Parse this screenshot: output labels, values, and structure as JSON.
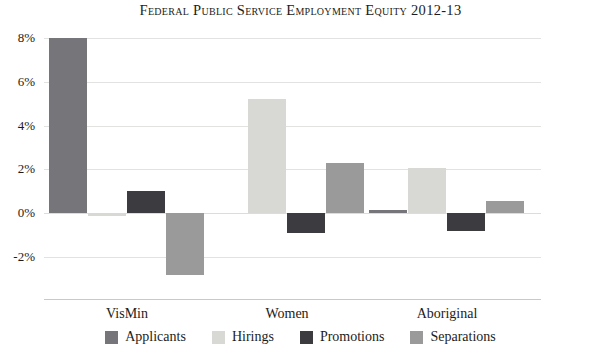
{
  "chart_data": {
    "type": "bar",
    "title": "Federal Public Service Employment Equity 2012-13",
    "xlabel": "",
    "ylabel": "",
    "categories": [
      "VisMin",
      "Women",
      "Aboriginal"
    ],
    "series": [
      {
        "name": "Applicants",
        "color": "#76767a",
        "values": [
          8.0,
          0.0,
          0.15
        ]
      },
      {
        "name": "Hirings",
        "color": "#d8d8d4",
        "values": [
          -0.15,
          5.2,
          2.05
        ]
      },
      {
        "name": "Promotions",
        "color": "#3c3c40",
        "values": [
          1.0,
          -0.9,
          -0.8
        ]
      },
      {
        "name": "Separations",
        "color": "#9a9a9a",
        "values": [
          -2.8,
          2.3,
          0.55
        ]
      }
    ],
    "ylim": [
      -3.2,
      8.6
    ],
    "yticks": [
      8,
      6,
      4,
      2,
      0,
      -2
    ],
    "ytick_labels": [
      "8%",
      "6%",
      "4%",
      "2%",
      "0%",
      "-2%"
    ],
    "grid": true,
    "legend_position": "bottom",
    "value_suffix": "%"
  }
}
